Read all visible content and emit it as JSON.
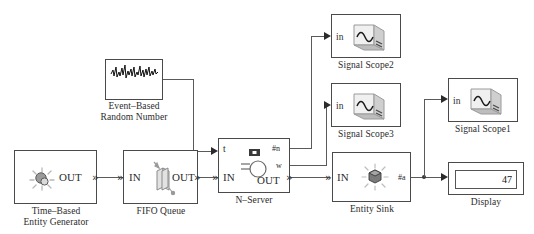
{
  "diagram": {
    "background": "#ffffff",
    "line_color": "#5a5a5a",
    "border_color": "#4a4a4a"
  },
  "blocks": {
    "entity_generator": {
      "label": "Time–Based\nEntity Generator",
      "icon": "entity-generator-icon",
      "ports_out": [
        "OUT"
      ]
    },
    "fifo_queue": {
      "label": "FIFO Queue",
      "icon": "queue-icon",
      "ports_in": [
        "IN"
      ],
      "ports_out": [
        "OUT"
      ]
    },
    "random_number": {
      "label": "Event–Based\nRandom Number",
      "icon": "random-noise-icon"
    },
    "n_server": {
      "label": "N–Server",
      "icon": "n-server-icon",
      "ports_in": [
        "t",
        "IN"
      ],
      "ports_out": [
        "#n",
        "w",
        "OUT"
      ]
    },
    "entity_sink": {
      "label": "Entity Sink",
      "icon": "entity-sink-icon",
      "ports_in": [
        "IN"
      ],
      "ports_out": [
        "#a"
      ]
    },
    "signal_scope1": {
      "label": "Signal Scope1",
      "icon": "scope-icon",
      "ports_in": [
        "in"
      ]
    },
    "signal_scope2": {
      "label": "Signal Scope2",
      "icon": "scope-icon",
      "ports_in": [
        "in"
      ]
    },
    "signal_scope3": {
      "label": "Signal Scope3",
      "icon": "scope-icon",
      "ports_in": [
        "in"
      ]
    },
    "display": {
      "label": "Display",
      "value": "47"
    }
  }
}
